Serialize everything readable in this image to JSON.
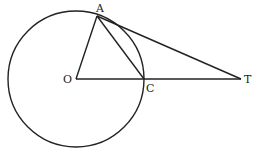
{
  "diagram": {
    "labels": {
      "A": "A",
      "O": "O",
      "C": "C",
      "T": "T"
    },
    "stroke_color": "#222222"
  }
}
